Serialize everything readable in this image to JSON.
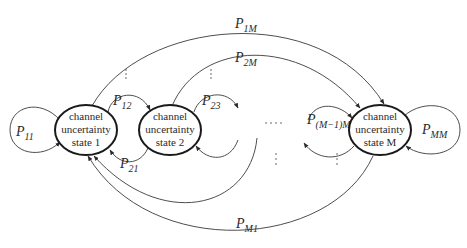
{
  "diagram": {
    "type": "markov-chain",
    "states": [
      {
        "id": "s1",
        "lines": [
          "channel",
          "uncertainty",
          "state 1"
        ],
        "cx": 86,
        "cy": 130
      },
      {
        "id": "s2",
        "lines": [
          "channel",
          "uncertainty",
          "state 2"
        ],
        "cx": 170,
        "cy": 130
      },
      {
        "id": "sM",
        "lines": [
          "channel",
          "uncertainty",
          "state M"
        ],
        "cx": 380,
        "cy": 130
      }
    ],
    "transitions": [
      {
        "id": "p11",
        "from": "state 1",
        "to": "state 1",
        "label_main": "P",
        "label_sub": "11"
      },
      {
        "id": "p12",
        "from": "state 1",
        "to": "state 2",
        "label_main": "P",
        "label_sub": "12"
      },
      {
        "id": "p21",
        "from": "state 2",
        "to": "state 1",
        "label_main": "P",
        "label_sub": "21"
      },
      {
        "id": "p23",
        "from": "state 2",
        "to": "state 3",
        "label_main": "P",
        "label_sub": "23"
      },
      {
        "id": "p1M",
        "from": "state 1",
        "to": "state M",
        "label_main": "P",
        "label_sub": "1M"
      },
      {
        "id": "p2M",
        "from": "state 2",
        "to": "state M",
        "label_main": "P",
        "label_sub": "2M"
      },
      {
        "id": "pM1M",
        "from": "state M-1",
        "to": "state M",
        "label_main": "P",
        "label_sub": "(M−1)M"
      },
      {
        "id": "pMM",
        "from": "state M",
        "to": "state M",
        "label_main": "P",
        "label_sub": "MM"
      },
      {
        "id": "pM1",
        "from": "state M",
        "to": "state 1",
        "label_main": "P",
        "label_sub": "M1"
      }
    ],
    "ellipses": {
      "horizontal": "....",
      "vertical": "⋮"
    }
  }
}
